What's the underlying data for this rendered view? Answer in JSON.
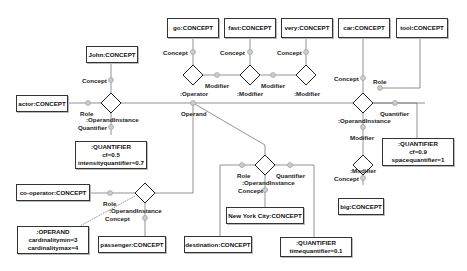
{
  "concepts": {
    "john": "John:CONCEPT",
    "actor": "actor:CONCEPT",
    "go": "go:CONCEPT",
    "fast": "fast:CONCEPT",
    "very": "very:CONCEPT",
    "car": "car:CONCEPT",
    "tool": "tool:CONCEPT",
    "big": "big:CONCEPT",
    "co_operator": "co-operator:CONCEPT",
    "passenger": "passenger:CONCEPT",
    "destination": "destination:CONCEPT",
    "new_york_city": "New York City:CONCEPT"
  },
  "quantifiers": {
    "intensity": {
      "title": ":QUANTIFIER",
      "line1": "cf=0.5",
      "line2": "intensityquantifier=0.7"
    },
    "space": {
      "title": ":QUANTIFIER",
      "line1": "cf=0.9",
      "line2": "spacequantifier=1"
    },
    "time": {
      "title": ":QUANTIFIER",
      "line1": "timequantifier=0.1"
    },
    "operand": {
      "title": ":OPERAND",
      "line1": "cardinalitymin=3",
      "line2": "cardinalitymax=4"
    }
  },
  "labels": {
    "concept": "Concept",
    "role": "Role",
    "quantifier": "Quantifier",
    "modifier": "Modifier",
    "operand": "Operand",
    "operand_instance": ":OperandInstance",
    "operator": ":Operator",
    "modifier_node": ":Modifier"
  }
}
